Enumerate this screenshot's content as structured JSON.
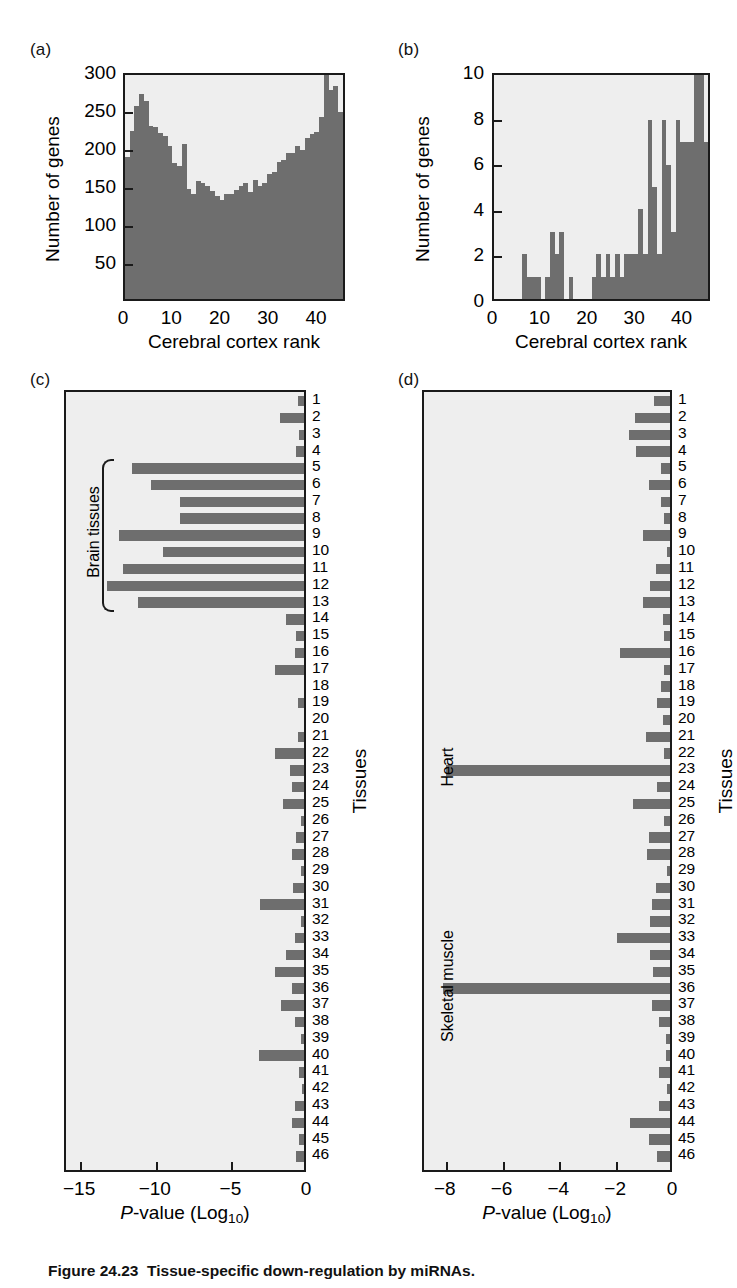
{
  "figure": {
    "caption_number": "Figure 24.23",
    "caption_text": "Tissue-specific down-regulation by miRNAs.",
    "bar_color": "#6e6e6e",
    "plot_background": "#eeeeee",
    "axis_color": "#1a1a1a"
  },
  "panels": {
    "a": {
      "label": "(a)",
      "xlabel": "Cerebral cortex rank",
      "ylabel": "Number of genes",
      "yticks": [
        "50",
        "100",
        "150",
        "200",
        "250",
        "300"
      ],
      "xticks": [
        "0",
        "10",
        "20",
        "30",
        "40"
      ]
    },
    "b": {
      "label": "(b)",
      "xlabel": "Cerebral cortex rank",
      "ylabel": "Number of genes",
      "yticks": [
        "0",
        "2",
        "4",
        "6",
        "8",
        "10"
      ],
      "xticks": [
        "0",
        "10",
        "20",
        "30",
        "40"
      ]
    },
    "c": {
      "label": "(c)",
      "xlabel_main": "P",
      "xlabel_rest": "-value (Log",
      "xlabel_sub": "10",
      "xlabel_end": ")",
      "ylabel": "Tissues",
      "xticks": [
        "−15",
        "−10",
        "−5",
        "0"
      ],
      "group_label": "Brain tissues"
    },
    "d": {
      "label": "(d)",
      "xlabel_main": "P",
      "xlabel_rest": "-value (Log",
      "xlabel_sub": "10",
      "xlabel_end": ")",
      "ylabel": "Tissues",
      "xticks": [
        "−8",
        "−6",
        "−4",
        "−2",
        "0"
      ],
      "group_label_heart": "Heart",
      "group_label_muscle": "Skeletal muscle"
    }
  },
  "row_numbers": [
    "1",
    "2",
    "3",
    "4",
    "5",
    "6",
    "7",
    "8",
    "9",
    "10",
    "11",
    "12",
    "13",
    "14",
    "15",
    "16",
    "17",
    "18",
    "19",
    "20",
    "21",
    "22",
    "23",
    "24",
    "25",
    "26",
    "27",
    "28",
    "29",
    "30",
    "31",
    "32",
    "33",
    "34",
    "35",
    "36",
    "37",
    "38",
    "39",
    "40",
    "41",
    "42",
    "43",
    "44",
    "45",
    "46"
  ],
  "chart_data": [
    {
      "type": "bar",
      "panel": "a",
      "title": "(a)",
      "xlabel": "Cerebral cortex rank",
      "ylabel": "Number of genes",
      "xlim": [
        0,
        46
      ],
      "ylim": [
        0,
        300
      ],
      "ytick_values": [
        50,
        100,
        150,
        200,
        250,
        300
      ],
      "xtick_values": [
        0,
        10,
        20,
        30,
        40
      ],
      "grid": false,
      "categories": [
        1,
        2,
        3,
        4,
        5,
        6,
        7,
        8,
        9,
        10,
        11,
        12,
        13,
        14,
        15,
        16,
        17,
        18,
        19,
        20,
        21,
        22,
        23,
        24,
        25,
        26,
        27,
        28,
        29,
        30,
        31,
        32,
        33,
        34,
        35,
        36,
        37,
        38,
        39,
        40,
        41,
        42,
        43,
        44,
        45,
        46
      ],
      "values": [
        190,
        225,
        258,
        275,
        265,
        232,
        230,
        222,
        218,
        205,
        182,
        178,
        208,
        147,
        140,
        158,
        155,
        152,
        145,
        138,
        132,
        140,
        141,
        146,
        152,
        155,
        143,
        160,
        152,
        156,
        168,
        170,
        183,
        186,
        195,
        195,
        205,
        200,
        215,
        221,
        224,
        244,
        300,
        280,
        285,
        250
      ]
    },
    {
      "type": "bar",
      "panel": "b",
      "title": "(b)",
      "xlabel": "Cerebral cortex rank",
      "ylabel": "Number of genes",
      "xlim": [
        0,
        46
      ],
      "ylim": [
        0,
        10
      ],
      "ytick_values": [
        0,
        2,
        4,
        6,
        8,
        10
      ],
      "xtick_values": [
        0,
        10,
        20,
        30,
        40
      ],
      "grid": false,
      "categories": [
        1,
        2,
        3,
        4,
        5,
        6,
        7,
        8,
        9,
        10,
        11,
        12,
        13,
        14,
        15,
        16,
        17,
        18,
        19,
        20,
        21,
        22,
        23,
        24,
        25,
        26,
        27,
        28,
        29,
        30,
        31,
        32,
        33,
        34,
        35,
        36,
        37,
        38,
        39,
        40,
        41,
        42,
        43,
        44,
        45,
        46
      ],
      "values": [
        0,
        0,
        0,
        0,
        0,
        0,
        2,
        1,
        1,
        1,
        0,
        1,
        3,
        2,
        3,
        0,
        1,
        0,
        0,
        0,
        0,
        1,
        2,
        1,
        2,
        1,
        2,
        1,
        2,
        2,
        2,
        4,
        2,
        8,
        5,
        2,
        8,
        6,
        3,
        8,
        7,
        7,
        7,
        10,
        10,
        7
      ]
    },
    {
      "type": "bar",
      "panel": "c",
      "title": "(c)",
      "orientation": "horizontal",
      "xlabel": "P-value (Log10)",
      "ylabel": "Tissues",
      "xlim": [
        -16,
        0
      ],
      "xtick_values": [
        -15,
        -10,
        -5,
        0
      ],
      "grid": false,
      "categories": [
        "1",
        "2",
        "3",
        "4",
        "5",
        "6",
        "7",
        "8",
        "9",
        "10",
        "11",
        "12",
        "13",
        "14",
        "15",
        "16",
        "17",
        "18",
        "19",
        "20",
        "21",
        "22",
        "23",
        "24",
        "25",
        "26",
        "27",
        "28",
        "29",
        "30",
        "31",
        "32",
        "33",
        "34",
        "35",
        "36",
        "37",
        "38",
        "39",
        "40",
        "41",
        "42",
        "43",
        "44",
        "45",
        "46"
      ],
      "values": [
        -0.4,
        -1.6,
        -0.3,
        -0.5,
        -11.4,
        -10.1,
        -8.2,
        -8.2,
        -12.2,
        -9.3,
        -12.0,
        -13.0,
        -11.0,
        -1.2,
        -0.5,
        -0.6,
        -1.9,
        0.0,
        -0.4,
        0.0,
        -0.4,
        -1.9,
        -0.9,
        -0.8,
        -1.4,
        -0.2,
        -0.5,
        -0.8,
        -0.2,
        -0.7,
        -2.9,
        -0.2,
        -0.6,
        -1.2,
        -1.9,
        -0.8,
        -1.5,
        -0.6,
        -0.2,
        -3.0,
        -0.3,
        -0.15,
        -0.6,
        -0.8,
        -0.3,
        -0.5
      ],
      "annotations": [
        {
          "text": "Brain tissues",
          "rows": [
            5,
            13
          ]
        }
      ]
    },
    {
      "type": "bar",
      "panel": "d",
      "title": "(d)",
      "orientation": "horizontal",
      "xlabel": "P-value (Log10)",
      "ylabel": "Tissues",
      "xlim": [
        -8.8,
        0
      ],
      "xtick_values": [
        -8,
        -6,
        -4,
        -2,
        0
      ],
      "grid": false,
      "categories": [
        "1",
        "2",
        "3",
        "4",
        "5",
        "6",
        "7",
        "8",
        "9",
        "10",
        "11",
        "12",
        "13",
        "14",
        "15",
        "16",
        "17",
        "18",
        "19",
        "20",
        "21",
        "22",
        "23",
        "24",
        "25",
        "26",
        "27",
        "28",
        "29",
        "30",
        "31",
        "32",
        "33",
        "34",
        "35",
        "36",
        "37",
        "38",
        "39",
        "40",
        "41",
        "42",
        "43",
        "44",
        "45",
        "46"
      ],
      "values": [
        -0.55,
        -1.25,
        -1.45,
        -1.2,
        -0.3,
        -0.75,
        -0.3,
        -0.2,
        -0.95,
        -0.1,
        -0.5,
        -0.72,
        -0.95,
        -0.25,
        -0.2,
        -1.75,
        -0.2,
        -0.3,
        -0.45,
        -0.25,
        -0.85,
        -0.2,
        -7.9,
        -0.45,
        -1.3,
        -0.2,
        -0.75,
        -0.8,
        -0.1,
        -0.5,
        -0.65,
        -0.7,
        -1.85,
        -0.7,
        -0.6,
        -8.0,
        -0.65,
        -0.4,
        -0.15,
        -0.15,
        -0.4,
        -0.1,
        -0.4,
        -1.4,
        -0.75,
        -0.45
      ],
      "annotations": [
        {
          "text": "Heart",
          "rows": [
            23,
            23
          ]
        },
        {
          "text": "Skeletal muscle",
          "rows": [
            36,
            36
          ]
        }
      ]
    }
  ]
}
